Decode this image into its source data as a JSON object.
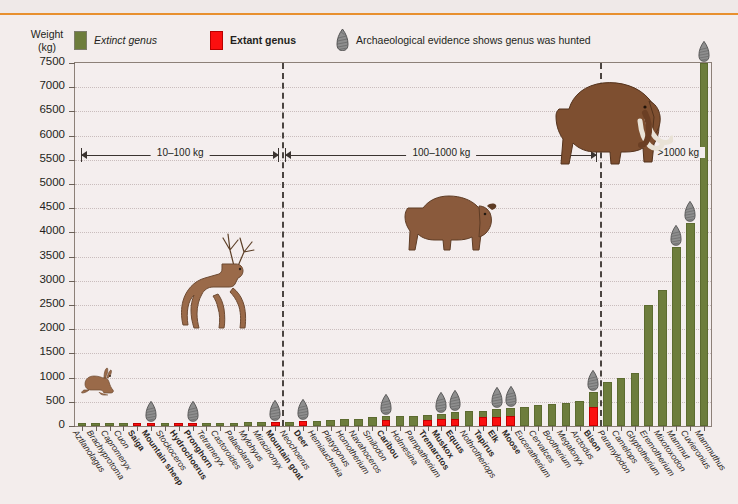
{
  "legend": {
    "extinct_label": "Extinct genus",
    "extant_label": "Extant genus",
    "hunted_label": "Archaeological evidence shows genus was hunted",
    "extinct_color": "#6d7d3c",
    "extant_color": "#fb0f0f",
    "point_icon": "spear-point-icon"
  },
  "axis": {
    "y_title_line1": "Weight",
    "y_title_line2": "(kg)",
    "y_ticks": [
      "7500",
      "7000",
      "6500",
      "6000",
      "5500",
      "5000",
      "4500",
      "4000",
      "3500",
      "3000",
      "2500",
      "2000",
      "1500",
      "1000",
      "500",
      "0"
    ]
  },
  "ranges": [
    {
      "label": "10–100 kg"
    },
    {
      "label": "100–1000 kg"
    },
    {
      "label": ">1000 kg"
    }
  ],
  "chart_data": {
    "type": "bar",
    "title": "",
    "xlabel": "",
    "ylabel": "Weight (kg)",
    "ylim": [
      0,
      7500
    ],
    "ytick_step": 500,
    "grid": true,
    "legend_position": "top",
    "series_note": "Bar color encodes status: green = extinct genus, red = extant genus. Spear-point marker = archaeological evidence of hunting.",
    "range_dividers_after": [
      "Mountain goat",
      "Bison"
    ],
    "categories": [
      "Aztlanolagus",
      "Brachyprotoma",
      "Capromeryx",
      "Cuon",
      "Saiga",
      "Mountain sheep",
      "Stockoceros",
      "Hydrochoerus",
      "Pronghorn",
      "Tetrameryx",
      "Castoroides",
      "Palaeolama",
      "Mylohyus",
      "Miracinonyx",
      "Mountain goat",
      "Neochoerus",
      "Deer",
      "Hemiauchenia",
      "Platygonus",
      "Homotherium",
      "Navahoceros",
      "Smilodon",
      "Caribou",
      "Holmesina",
      "Pampatherium",
      "Tremarctos",
      "Muskox",
      "Equus",
      "Nothrotheriops",
      "Tapirus",
      "Elk",
      "Moose",
      "Euceratherium",
      "Cervalces",
      "Bootherium",
      "Megalonyx",
      "Arctodus",
      "Bison",
      "Paramylodon",
      "Camelops",
      "Glyptotherium",
      "Eremotherium",
      "Mixotoxodon",
      "Mammut",
      "Cuvieronius",
      "Mammuthus"
    ],
    "values": [
      3,
      4,
      10,
      15,
      38,
      55,
      55,
      55,
      57,
      60,
      65,
      70,
      75,
      80,
      85,
      90,
      95,
      110,
      120,
      140,
      150,
      180,
      200,
      210,
      215,
      225,
      250,
      280,
      300,
      320,
      350,
      380,
      400,
      430,
      450,
      480,
      520,
      700,
      900,
      1000,
      1100,
      2500,
      2800,
      3700,
      4200,
      7500
    ],
    "status": [
      "extinct",
      "extinct",
      "extinct",
      "extinct",
      "extant",
      "extant",
      "extinct",
      "extant",
      "extant",
      "extinct",
      "extinct",
      "extinct",
      "extinct",
      "extinct",
      "extant",
      "extinct",
      "extant",
      "extinct",
      "extinct",
      "extinct",
      "extinct",
      "extinct",
      "extant",
      "extinct",
      "extinct",
      "extant",
      "extant",
      "extant",
      "extinct",
      "extant",
      "extant",
      "extant",
      "extinct",
      "extinct",
      "extinct",
      "extinct",
      "extinct",
      "extant",
      "extinct",
      "extinct",
      "extinct",
      "extinct",
      "extinct",
      "extinct",
      "extinct",
      "extinct"
    ],
    "hunted": [
      false,
      false,
      false,
      false,
      false,
      true,
      false,
      false,
      true,
      false,
      false,
      false,
      false,
      false,
      true,
      false,
      true,
      false,
      false,
      false,
      false,
      false,
      true,
      false,
      false,
      false,
      true,
      true,
      false,
      false,
      true,
      true,
      false,
      false,
      false,
      false,
      false,
      true,
      false,
      false,
      false,
      false,
      false,
      true,
      true,
      true
    ]
  },
  "illustrations": [
    {
      "name": "rabbit-illustration"
    },
    {
      "name": "deer-illustration"
    },
    {
      "name": "bison-illustration"
    },
    {
      "name": "mammoth-illustration"
    }
  ]
}
